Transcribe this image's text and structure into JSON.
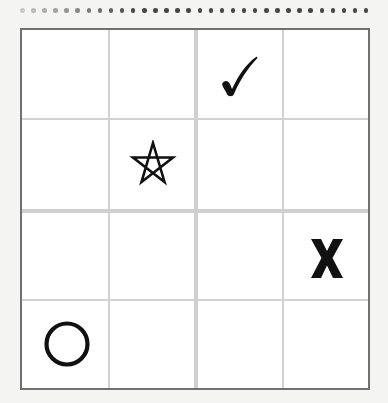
{
  "puzzle": {
    "type": "4x4 symbol grid",
    "rows": 4,
    "cols": 4,
    "box_size": "2x2",
    "colors": {
      "background": "#f4f4f3",
      "board": "#ffffff",
      "border": "#707070",
      "grid_line": "#d2d2d2",
      "symbol": "#111111"
    },
    "cells": [
      [
        "",
        "",
        "check",
        ""
      ],
      [
        "",
        "star",
        "",
        ""
      ],
      [
        "",
        "",
        "",
        "x"
      ],
      [
        "circle",
        "",
        "",
        ""
      ]
    ],
    "placed_symbols": [
      {
        "row": 0,
        "col": 2,
        "symbol": "check",
        "icon": "checkmark-icon"
      },
      {
        "row": 1,
        "col": 1,
        "symbol": "star",
        "icon": "star-outline-icon"
      },
      {
        "row": 2,
        "col": 3,
        "symbol": "x",
        "icon": "x-letter-icon"
      },
      {
        "row": 3,
        "col": 0,
        "symbol": "circle",
        "icon": "circle-outline-icon"
      }
    ]
  }
}
